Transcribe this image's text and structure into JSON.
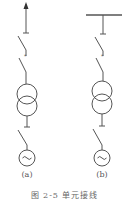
{
  "figure": {
    "caption": "图 2-5  单元接线",
    "stroke_color": "#555555",
    "panels": [
      {
        "id": "a",
        "label": "(a)",
        "top_terminal": "arrow-up",
        "elements": [
          "disconnect-switch",
          "circuit-breaker",
          "two-winding-transformer",
          "circuit-breaker",
          "ac-generator"
        ]
      },
      {
        "id": "b",
        "label": "(b)",
        "top_terminal": "busbar",
        "elements": [
          "disconnect-switch",
          "circuit-breaker",
          "two-winding-transformer",
          "circuit-breaker",
          "ac-generator"
        ]
      }
    ],
    "generator_symbol": "~"
  }
}
